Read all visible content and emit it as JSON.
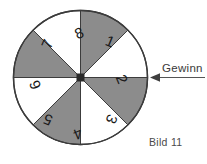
{
  "figure": {
    "caption": "Bild 11",
    "pointer_label": "Gewinn",
    "wheel": {
      "name": "spinner-wheel",
      "sector_count": 8,
      "sectors": [
        {
          "number": "1",
          "fill": "gray",
          "start_deg": 0,
          "end_deg": 45
        },
        {
          "number": "2",
          "fill": "white",
          "start_deg": 45,
          "end_deg": 90
        },
        {
          "number": "3",
          "fill": "gray",
          "start_deg": 90,
          "end_deg": 135
        },
        {
          "number": "4",
          "fill": "white",
          "start_deg": 135,
          "end_deg": 180
        },
        {
          "number": "5",
          "fill": "gray",
          "start_deg": 180,
          "end_deg": 225
        },
        {
          "number": "6",
          "fill": "white",
          "start_deg": 225,
          "end_deg": 270
        },
        {
          "number": "7",
          "fill": "gray",
          "start_deg": 270,
          "end_deg": 315
        },
        {
          "number": "8",
          "fill": "white",
          "start_deg": 315,
          "end_deg": 360
        }
      ],
      "winning_sector": "2"
    },
    "colors": {
      "gray_sector": "#8c8c8c",
      "white_sector": "#ffffff",
      "outline": "#3c3c3c",
      "hub": "#2a2a2a",
      "arrow": "#4a4a4a",
      "text": "#1a1a1a",
      "background": "#ffffff"
    }
  }
}
